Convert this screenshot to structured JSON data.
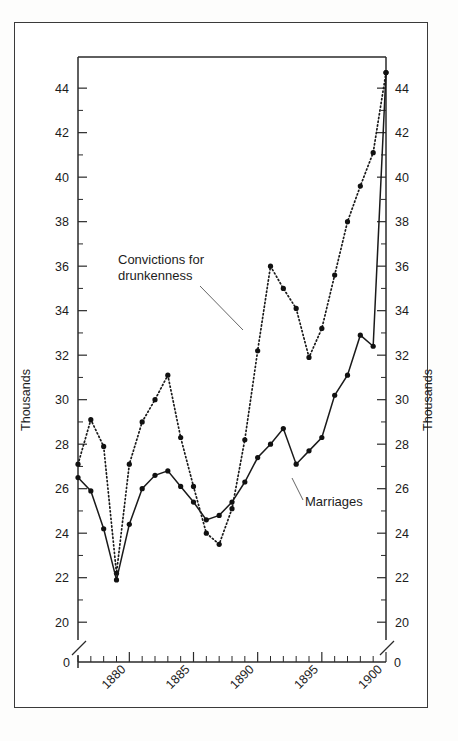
{
  "figure": {
    "background_color": "#ffffff",
    "frame_color": "#3a3a3a",
    "ink_color": "#1a1a1a"
  },
  "axes": {
    "left_axis_title": "Thousands",
    "right_axis_title": "Thousands",
    "y_tick_labels": [
      "20",
      "22",
      "24",
      "26",
      "28",
      "30",
      "32",
      "34",
      "36",
      "38",
      "40",
      "42",
      "44"
    ],
    "y_zero_label": "0",
    "x_tick_labels": [
      "1880",
      "1885",
      "1890",
      "1895",
      "1900"
    ],
    "y_axis_break": true
  },
  "annotations": [
    {
      "id": "convictions",
      "text_line_1": "Convictions for",
      "text_line_2": "drunkenness"
    },
    {
      "id": "marriages",
      "text_line_1": "Marriages",
      "text_line_2": ""
    }
  ],
  "chart_data": {
    "type": "line",
    "title": "",
    "subtitle": "",
    "xlabel": "",
    "ylabel": "Thousands",
    "xlim": [
      1876,
      1900
    ],
    "ylim": [
      19.2,
      45.4
    ],
    "grid": false,
    "legend_position": "inline-annotation",
    "y_unit": "Thousands",
    "y_tick_step": 2,
    "y_minor_tick_step": 1,
    "x_tick_step": 1,
    "x_labeled_years": [
      1880,
      1885,
      1890,
      1895,
      1900
    ],
    "x": [
      1876,
      1877,
      1878,
      1879,
      1880,
      1881,
      1882,
      1883,
      1884,
      1885,
      1886,
      1887,
      1888,
      1889,
      1890,
      1891,
      1892,
      1893,
      1894,
      1895,
      1896,
      1897,
      1898,
      1899,
      1900
    ],
    "series": [
      {
        "name": "Convictions for drunkenness",
        "style": "dotted",
        "marker": "filled-circle",
        "values": [
          27.1,
          29.1,
          27.9,
          22.2,
          27.1,
          29.0,
          30.0,
          31.1,
          28.3,
          26.1,
          24.0,
          23.5,
          25.1,
          28.2,
          32.2,
          36.0,
          35.0,
          34.1,
          31.9,
          33.2,
          35.6,
          38.0,
          39.6,
          41.1,
          44.7
        ]
      },
      {
        "name": "Marriages",
        "style": "solid",
        "marker": "filled-circle",
        "values": [
          26.5,
          25.9,
          24.2,
          21.9,
          24.4,
          26.0,
          26.6,
          26.8,
          26.1,
          25.4,
          24.6,
          24.8,
          25.4,
          26.3,
          27.4,
          28.0,
          28.7,
          27.1,
          27.7,
          28.3,
          30.2,
          31.1,
          32.9,
          32.4,
          44.7
        ]
      }
    ],
    "notes": {
      "convictions_last_two_points_equal": "1899 and 1900 both near 44.7",
      "marriages_series_ends_1899": "Marriages solid line visible through 1899 at about 32.4"
    }
  }
}
